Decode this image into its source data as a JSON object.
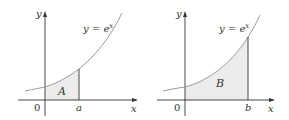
{
  "colors": {
    "axis": "#333333",
    "curve": "#9a9a9a",
    "fill": "#ececec",
    "text": "#333333",
    "background": "#ffffff"
  },
  "graphs": [
    {
      "id": "left",
      "axis_labels": {
        "y": "y",
        "x": "x"
      },
      "origin_label": "0",
      "bound_label": "a",
      "region_label": "A",
      "function_label": {
        "lhs": "y = e",
        "exp": "x"
      }
    },
    {
      "id": "right",
      "axis_labels": {
        "y": "y",
        "x": "x"
      },
      "origin_label": "0",
      "bound_label": "b",
      "region_label": "B",
      "function_label": {
        "lhs": "y = e",
        "exp": "x"
      }
    }
  ]
}
